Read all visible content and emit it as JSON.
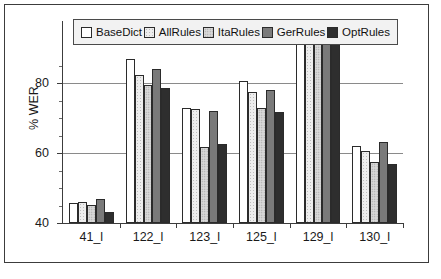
{
  "chart_data": {
    "type": "bar",
    "title": "",
    "xlabel": "",
    "ylabel": "% WER",
    "ylim": [
      40,
      88
    ],
    "yticks": [
      40,
      60,
      80
    ],
    "ytick_labels": [
      "40",
      "60",
      "80"
    ],
    "grid": true,
    "legend_position": "top-inside",
    "categories": [
      "41_l",
      "122_l",
      "123_l",
      "125_l",
      "129_l",
      "130_l"
    ],
    "series": [
      {
        "name": "BaseDict",
        "fill": "white",
        "values": [
          44.7,
          79.0,
          67.3,
          73.8,
          86.2,
          58.2
        ]
      },
      {
        "name": "AllRules",
        "fill": "very-light-gray-dots",
        "values": [
          45.0,
          75.2,
          67.0,
          71.1,
          85.8,
          57.0
        ]
      },
      {
        "name": "ItaRules",
        "fill": "light-gray-dots",
        "values": [
          44.2,
          72.8,
          58.1,
          67.4,
          83.6,
          54.6
        ]
      },
      {
        "name": "GerRules",
        "fill": "mid-gray-dots",
        "values": [
          45.6,
          76.7,
          66.5,
          71.7,
          85.0,
          59.2
        ]
      },
      {
        "name": "OptRules",
        "fill": "dark-gray-dots",
        "values": [
          42.7,
          72.2,
          58.7,
          66.3,
          83.6,
          54.1
        ]
      }
    ]
  },
  "legend": {
    "entries": [
      {
        "label": "BaseDict"
      },
      {
        "label": "AllRules"
      },
      {
        "label": "ItaRules"
      },
      {
        "label": "GerRules"
      },
      {
        "label": "OptRules"
      }
    ]
  },
  "colors": {
    "frame": "#3c3c3c",
    "axis": "#3c3c3c",
    "gridline": "#8a8a8a",
    "bar_outline": "#2b2b2b",
    "text": "#1a1a1a",
    "legend_background": "#f2f2f2"
  }
}
